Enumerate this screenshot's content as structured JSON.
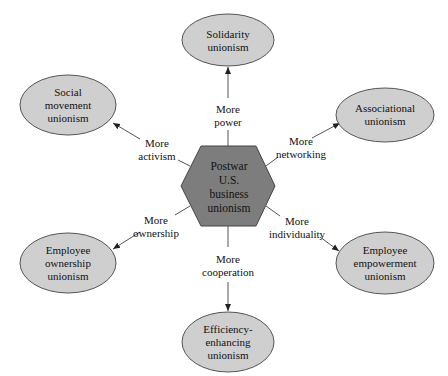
{
  "center": {
    "lines": [
      "Postwar",
      "U.S.",
      "business",
      "unionism"
    ],
    "fill": "#7d7d7d"
  },
  "nodes": [
    {
      "id": "solidarity",
      "lines": [
        "Solidarity",
        "unionism"
      ]
    },
    {
      "id": "social-movement",
      "lines": [
        "Social",
        "movement",
        "unionism"
      ]
    },
    {
      "id": "associational",
      "lines": [
        "Associational",
        "unionism"
      ]
    },
    {
      "id": "employee-ownership",
      "lines": [
        "Employee",
        "ownership",
        "unionism"
      ]
    },
    {
      "id": "employee-empowerment",
      "lines": [
        "Employee",
        "empowerment",
        "unionism"
      ]
    },
    {
      "id": "efficiency-enhancing",
      "lines": [
        "Efficiency-",
        "enhancing",
        "unionism"
      ]
    }
  ],
  "edges": [
    {
      "to": "solidarity",
      "label": [
        "More",
        "power"
      ]
    },
    {
      "to": "social-movement",
      "label": [
        "More",
        "activism"
      ]
    },
    {
      "to": "associational",
      "label": [
        "More",
        "networking"
      ]
    },
    {
      "to": "employee-ownership",
      "label": [
        "More",
        "ownership"
      ]
    },
    {
      "to": "employee-empowerment",
      "label": [
        "More",
        "individuality"
      ]
    },
    {
      "to": "efficiency-enhancing",
      "label": [
        "More",
        "cooperation"
      ]
    }
  ],
  "colors": {
    "ellipse_fill": "#cfcfcf",
    "stroke": "#555555"
  }
}
